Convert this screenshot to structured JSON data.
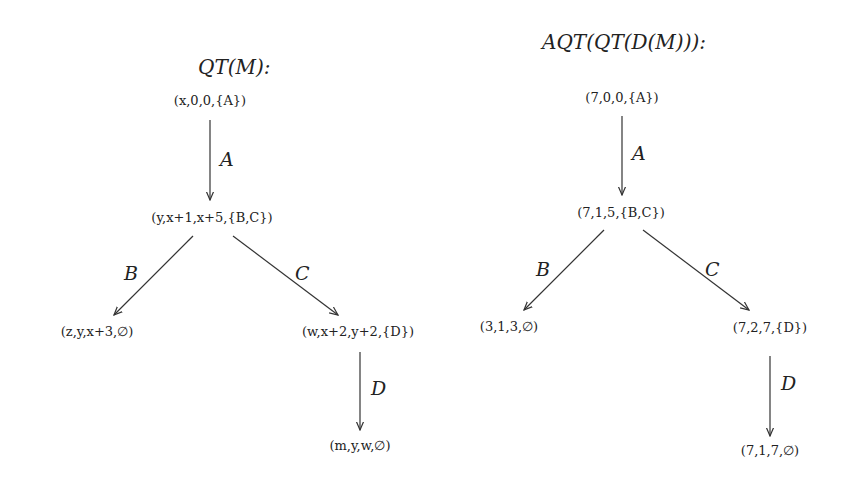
{
  "left_tree": {
    "title": "QT(M):",
    "nodes": {
      "root": "(x,0,0,{A})",
      "mid": "(y,x+1,x+5,{B,C})",
      "left": "(z,y,x+3,∅)",
      "right": "(w,x+2,y+2,{D})",
      "leaf": "(m,y,w,∅)"
    },
    "edges": {
      "a": "A",
      "b": "B",
      "c": "C",
      "d": "D"
    }
  },
  "right_tree": {
    "title": "AQT(QT(D(M))):",
    "nodes": {
      "root": "(7,0,0,{A})",
      "mid": "(7,1,5,{B,C})",
      "left": "(3,1,3,∅)",
      "right": "(7,2,7,{D})",
      "leaf": "(7,1,7,∅)"
    },
    "edges": {
      "a": "A",
      "b": "B",
      "c": "C",
      "d": "D"
    }
  }
}
